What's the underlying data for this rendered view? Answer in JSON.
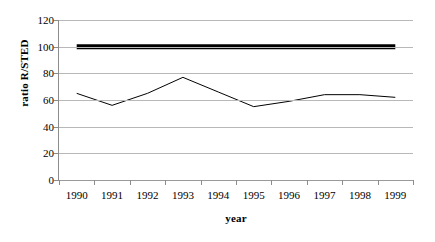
{
  "chart_data": {
    "type": "line",
    "title": "",
    "xlabel": "year",
    "ylabel": "ratio R/STED",
    "x": [
      1990,
      1991,
      1992,
      1993,
      1994,
      1995,
      1996,
      1997,
      1998,
      1999
    ],
    "categories": [
      "1990",
      "1991",
      "1992",
      "1993",
      "1994",
      "1995",
      "1996",
      "1997",
      "1998",
      "1999"
    ],
    "series": [
      {
        "name": "ratio R/STED",
        "values": [
          65,
          56,
          65,
          77,
          66,
          55,
          59,
          64,
          64,
          62
        ],
        "color": "#000000",
        "line_width": 1
      },
      {
        "name": "reference-100",
        "values": [
          100,
          100,
          100,
          100,
          100,
          100,
          100,
          100,
          100,
          100
        ],
        "color": "#000000",
        "line_width": 5
      }
    ],
    "ylim": [
      0,
      120
    ],
    "y_ticks": [
      0,
      20,
      40,
      60,
      80,
      100,
      120
    ],
    "y_tick_labels": [
      "0",
      "20",
      "40",
      "60",
      "80",
      "100",
      "120"
    ],
    "grid": true,
    "grid_color": "#b8b8b8",
    "legend": "none",
    "legend_position": "none",
    "axis_color": "#8c8c8c",
    "background": "#ffffff"
  },
  "axes": {
    "y_title": "ratio R/STED",
    "x_title": "year"
  }
}
